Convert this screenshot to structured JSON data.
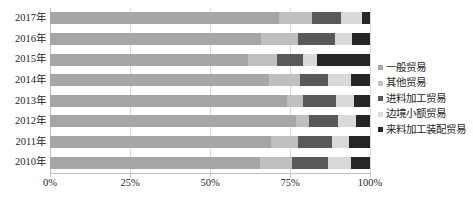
{
  "chart_data": {
    "type": "bar",
    "orientation": "horizontal",
    "stacked": "100%",
    "title": "",
    "xlabel": "",
    "ylabel": "",
    "xlim": [
      0,
      100
    ],
    "grid": true,
    "legend_position": "right",
    "categories": [
      "2017年",
      "2016年",
      "2015年",
      "2014年",
      "2013年",
      "2012年",
      "2011年",
      "2010年"
    ],
    "xticks": [
      "0%",
      "25%",
      "50%",
      "75%",
      "100%"
    ],
    "xtick_values": [
      0,
      25,
      50,
      75,
      100
    ],
    "series": [
      {
        "name": "一般贸易",
        "color": "#a6a6a6",
        "values": [
          71.5,
          66.0,
          62.0,
          68.5,
          74.0,
          77.0,
          69.0,
          65.5
        ]
      },
      {
        "name": "其他贸易",
        "color": "#bfbfbf",
        "values": [
          10.5,
          11.5,
          9.0,
          9.5,
          5.0,
          4.0,
          8.5,
          10.0
        ]
      },
      {
        "name": "进料加工贸易",
        "color": "#595959",
        "values": [
          9.0,
          11.5,
          8.0,
          9.0,
          10.5,
          9.0,
          10.5,
          11.5
        ]
      },
      {
        "name": "边境小额贸易",
        "color": "#d9d9d9",
        "values": [
          6.5,
          5.5,
          4.5,
          7.0,
          5.5,
          5.5,
          5.5,
          7.0
        ]
      },
      {
        "name": "来料加工装配贸易",
        "color": "#262626",
        "values": [
          2.5,
          5.5,
          16.5,
          6.0,
          5.0,
          4.5,
          6.5,
          6.0
        ]
      }
    ]
  },
  "legend": {
    "items": [
      {
        "label": "一般贸易"
      },
      {
        "label": "其他贸易"
      },
      {
        "label": "进料加工贸易"
      },
      {
        "label": "边境小额贸易"
      },
      {
        "label": "来料加工装配贸易"
      }
    ]
  }
}
